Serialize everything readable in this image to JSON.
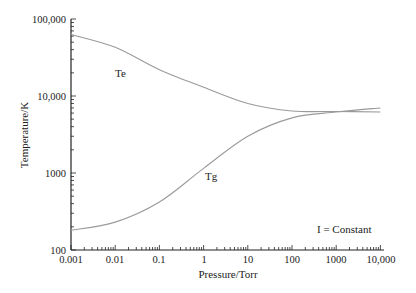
{
  "chart_data": {
    "type": "line",
    "title": "",
    "xlabel": "Pressure/Torr",
    "ylabel": "Temperature/K",
    "xscale": "log",
    "yscale": "log",
    "xlim": [
      0.001,
      10000
    ],
    "ylim": [
      100,
      100000
    ],
    "x_tick_labels": [
      "0.001",
      "0.01",
      "0.1",
      "1",
      "10",
      "100",
      "1000",
      "10,000"
    ],
    "y_tick_labels": [
      "100",
      "1000",
      "10,000",
      "100,000"
    ],
    "grid": false,
    "legend": "none",
    "annotations": [
      {
        "text": "Te",
        "x": 0.02,
        "y": 30000
      },
      {
        "text": "Tg",
        "x": 1.5,
        "y": 750
      },
      {
        "text": "I = Constant",
        "x": 1500,
        "y": 200
      }
    ],
    "x": [
      0.001,
      0.01,
      0.1,
      1,
      10,
      100,
      1000,
      10000
    ],
    "series": [
      {
        "name": "Te",
        "values": [
          63000,
          43000,
          22000,
          13000,
          8000,
          6400,
          6300,
          6200
        ]
      },
      {
        "name": "Tg",
        "values": [
          180,
          230,
          420,
          1150,
          3000,
          5200,
          6200,
          7000
        ]
      }
    ]
  },
  "labels": {
    "xlabel": "Pressure/Torr",
    "ylabel": "Temperature/K",
    "te": "Te",
    "tg": "Tg",
    "condition": "I = Constant",
    "xticks": [
      "0.001",
      "0.01",
      "0.1",
      "1",
      "10",
      "100",
      "1000",
      "10,000"
    ],
    "yticks": [
      "100",
      "1000",
      "10,000",
      "100,000"
    ]
  },
  "colors": {
    "axis": "#222222",
    "curve": "#999999"
  }
}
